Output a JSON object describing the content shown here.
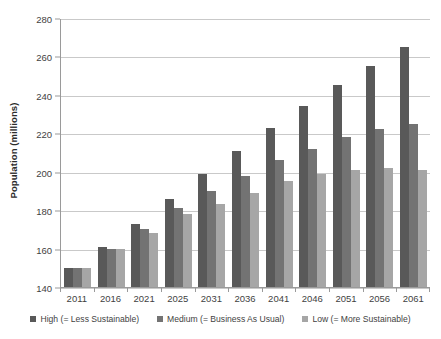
{
  "chart_data": {
    "type": "bar",
    "title": "",
    "xlabel": "",
    "ylabel": "Population (millions)",
    "categories": [
      "2011",
      "2016",
      "2021",
      "2025",
      "2031",
      "2036",
      "2041",
      "2046",
      "2051",
      "2056",
      "2061"
    ],
    "series": [
      {
        "name": "High (= Less Sustainable)",
        "color": "#595959",
        "values": [
          150,
          161,
          173,
          186,
          199,
          211,
          223,
          234,
          245,
          255,
          265
        ]
      },
      {
        "name": "Medium (= Business As Usual)",
        "color": "#737373",
        "values": [
          150,
          160,
          170,
          181,
          190,
          198,
          206,
          212,
          218,
          222,
          225
        ]
      },
      {
        "name": "Low (= More Sustainable)",
        "color": "#a6a6a6",
        "values": [
          150,
          160,
          168,
          178,
          183,
          189,
          195,
          199,
          201,
          202,
          201
        ]
      }
    ],
    "ylim": [
      140,
      280
    ],
    "yticks": [
      140,
      160,
      180,
      200,
      220,
      240,
      260,
      280
    ],
    "grid": true,
    "legend_position": "bottom"
  },
  "axis": {
    "y_title": "Population (millions)",
    "y_tick_labels": [
      "140",
      "160",
      "180",
      "200",
      "220",
      "240",
      "260",
      "280"
    ]
  },
  "legend": {
    "items": [
      {
        "label": "High (= Less Sustainable)"
      },
      {
        "label": "Medium (= Business As Usual)"
      },
      {
        "label": "Low (= More Sustainable)"
      }
    ]
  }
}
